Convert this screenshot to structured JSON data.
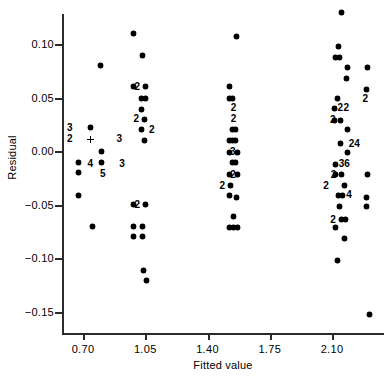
{
  "chart_data": {
    "type": "scatter",
    "title": "",
    "xlabel": "Fitted value",
    "ylabel": "Residual",
    "xlim": [
      0.58,
      2.39
    ],
    "ylim": [
      -0.168,
      0.138
    ],
    "grid": false,
    "legend": null,
    "xticks": [
      0.7,
      1.05,
      1.4,
      1.75,
      2.1
    ],
    "xtick_labels": [
      "0.70",
      "1.05",
      "1.40",
      "1.75",
      "2.10"
    ],
    "yticks": [
      0.1,
      0.05,
      0.0,
      -0.05,
      -0.1,
      -0.15
    ],
    "ytick_labels": [
      "0.10",
      "0.05",
      "0.00",
      "−0.05",
      "−0.10",
      "−0.15"
    ],
    "marker": "filled-diamond",
    "note": "Count digits next to a marker denote overplotted observations at that location.",
    "points": [
      {
        "x": 0.672,
        "y": 0.022,
        "count": 3,
        "label_side": "left",
        "marker": "none"
      },
      {
        "x": 0.672,
        "y": 0.011,
        "count": 2,
        "label_side": "left",
        "marker": "none"
      },
      {
        "x": 0.672,
        "y": -0.011,
        "count": 1,
        "marker": "dot"
      },
      {
        "x": 0.672,
        "y": -0.02,
        "count": 1,
        "marker": "dot"
      },
      {
        "x": 0.672,
        "y": -0.041,
        "count": 1,
        "marker": "dot"
      },
      {
        "x": 0.74,
        "y": 0.022,
        "count": 1,
        "marker": "dot"
      },
      {
        "x": 0.74,
        "y": 0.011,
        "count": 1,
        "marker": "plus"
      },
      {
        "x": 0.742,
        "y": -0.012,
        "count": 4,
        "label_side": "center",
        "marker": "none"
      },
      {
        "x": 0.752,
        "y": -0.07,
        "count": 1,
        "marker": "dot"
      },
      {
        "x": 0.8,
        "y": 0.08,
        "count": 1,
        "marker": "dot"
      },
      {
        "x": 0.806,
        "y": 0.0,
        "count": 1,
        "marker": "dot"
      },
      {
        "x": 0.806,
        "y": -0.011,
        "count": 1,
        "marker": "dot"
      },
      {
        "x": 0.812,
        "y": -0.021,
        "count": 5,
        "label_side": "center",
        "marker": "none"
      },
      {
        "x": 0.905,
        "y": 0.011,
        "count": 3,
        "label_side": "center",
        "marker": "none"
      },
      {
        "x": 0.92,
        "y": -0.012,
        "count": 3,
        "label_side": "center",
        "marker": "none"
      },
      {
        "x": 0.986,
        "y": 0.11,
        "count": 1,
        "marker": "dot"
      },
      {
        "x": 0.982,
        "y": 0.06,
        "count": 1,
        "marker": "dot"
      },
      {
        "x": 1.035,
        "y": 0.089,
        "count": 1,
        "marker": "dot"
      },
      {
        "x": 1.052,
        "y": 0.06,
        "count": 2,
        "label_side": "left",
        "marker": "dot"
      },
      {
        "x": 1.03,
        "y": 0.049,
        "count": 1,
        "marker": "dot"
      },
      {
        "x": 1.052,
        "y": 0.049,
        "count": 1,
        "marker": "dot"
      },
      {
        "x": 1.03,
        "y": 0.039,
        "count": 1,
        "marker": "dot"
      },
      {
        "x": 1.046,
        "y": 0.03,
        "count": 2,
        "label_side": "left",
        "marker": "dot"
      },
      {
        "x": 1.03,
        "y": 0.02,
        "count": 1,
        "marker": "dot"
      },
      {
        "x": 1.048,
        "y": 0.02,
        "count": 2,
        "label_side": "right",
        "marker": "none"
      },
      {
        "x": 1.046,
        "y": 0.01,
        "count": 1,
        "marker": "dot"
      },
      {
        "x": 0.982,
        "y": -0.05,
        "count": 1,
        "marker": "dot"
      },
      {
        "x": 1.052,
        "y": -0.05,
        "count": 2,
        "label_side": "left",
        "marker": "dot"
      },
      {
        "x": 0.982,
        "y": -0.07,
        "count": 1,
        "marker": "dot"
      },
      {
        "x": 1.035,
        "y": -0.07,
        "count": 1,
        "marker": "dot"
      },
      {
        "x": 0.982,
        "y": -0.08,
        "count": 1,
        "marker": "dot"
      },
      {
        "x": 1.035,
        "y": -0.08,
        "count": 1,
        "marker": "dot"
      },
      {
        "x": 1.04,
        "y": -0.111,
        "count": 1,
        "marker": "dot"
      },
      {
        "x": 1.056,
        "y": -0.121,
        "count": 1,
        "marker": "dot"
      },
      {
        "x": 1.565,
        "y": 0.107,
        "count": 1,
        "marker": "dot"
      },
      {
        "x": 1.525,
        "y": 0.06,
        "count": 1,
        "marker": "dot"
      },
      {
        "x": 1.522,
        "y": 0.049,
        "count": 1,
        "marker": "dot"
      },
      {
        "x": 1.54,
        "y": 0.049,
        "count": 1,
        "marker": "dot"
      },
      {
        "x": 1.548,
        "y": 0.04,
        "count": 2,
        "label_side": "center",
        "marker": "none"
      },
      {
        "x": 1.548,
        "y": 0.03,
        "count": 2,
        "label_side": "center",
        "marker": "none"
      },
      {
        "x": 1.54,
        "y": 0.02,
        "count": 1,
        "marker": "dot"
      },
      {
        "x": 1.558,
        "y": 0.02,
        "count": 1,
        "marker": "dot"
      },
      {
        "x": 1.522,
        "y": 0.01,
        "count": 1,
        "marker": "dot"
      },
      {
        "x": 1.54,
        "y": 0.01,
        "count": 1,
        "marker": "dot"
      },
      {
        "x": 1.558,
        "y": 0.01,
        "count": 1,
        "marker": "dot"
      },
      {
        "x": 1.522,
        "y": -0.001,
        "count": 1,
        "marker": "dot"
      },
      {
        "x": 1.543,
        "y": -0.001,
        "count": 3,
        "label_side": "center",
        "marker": "none"
      },
      {
        "x": 1.566,
        "y": -0.001,
        "count": 1,
        "marker": "dot"
      },
      {
        "x": 1.54,
        "y": -0.011,
        "count": 1,
        "marker": "dot"
      },
      {
        "x": 1.558,
        "y": -0.011,
        "count": 1,
        "marker": "dot"
      },
      {
        "x": 1.522,
        "y": -0.022,
        "count": 1,
        "marker": "dot"
      },
      {
        "x": 1.545,
        "y": -0.022,
        "count": 2,
        "label_side": "center",
        "marker": "none"
      },
      {
        "x": 1.566,
        "y": -0.022,
        "count": 1,
        "marker": "dot"
      },
      {
        "x": 1.53,
        "y": -0.032,
        "count": 2,
        "label_side": "left",
        "marker": "dot"
      },
      {
        "x": 1.522,
        "y": -0.041,
        "count": 1,
        "marker": "dot"
      },
      {
        "x": 1.562,
        "y": -0.043,
        "count": 1,
        "marker": "dot"
      },
      {
        "x": 1.548,
        "y": -0.061,
        "count": 1,
        "marker": "dot"
      },
      {
        "x": 1.522,
        "y": -0.071,
        "count": 1,
        "marker": "dot"
      },
      {
        "x": 1.545,
        "y": -0.071,
        "count": 1,
        "marker": "dot"
      },
      {
        "x": 1.566,
        "y": -0.071,
        "count": 1,
        "marker": "dot"
      },
      {
        "x": 2.155,
        "y": 0.129,
        "count": 1,
        "marker": "dot"
      },
      {
        "x": 2.138,
        "y": 0.098,
        "count": 1,
        "marker": "dot"
      },
      {
        "x": 2.118,
        "y": 0.087,
        "count": 1,
        "marker": "dot"
      },
      {
        "x": 2.14,
        "y": 0.087,
        "count": 1,
        "marker": "dot"
      },
      {
        "x": 2.188,
        "y": 0.078,
        "count": 1,
        "marker": "dot"
      },
      {
        "x": 2.3,
        "y": 0.078,
        "count": 1,
        "marker": "dot"
      },
      {
        "x": 2.184,
        "y": 0.068,
        "count": 1,
        "marker": "dot"
      },
      {
        "x": 2.292,
        "y": 0.058,
        "count": 1,
        "marker": "dot"
      },
      {
        "x": 2.13,
        "y": 0.049,
        "count": 1,
        "marker": "dot"
      },
      {
        "x": 2.288,
        "y": 0.049,
        "count": 2,
        "label_side": "center",
        "marker": "none"
      },
      {
        "x": 2.112,
        "y": 0.04,
        "count": 1,
        "marker": "dot"
      },
      {
        "x": 2.148,
        "y": 0.04,
        "count": 2,
        "label_side": "center",
        "marker": "none"
      },
      {
        "x": 2.182,
        "y": 0.04,
        "count": 2,
        "label_side": "center",
        "marker": "none"
      },
      {
        "x": 2.112,
        "y": 0.029,
        "count": 1,
        "marker": "dot"
      },
      {
        "x": 2.15,
        "y": 0.029,
        "count": 2,
        "label_side": "left",
        "marker": "dot"
      },
      {
        "x": 2.185,
        "y": 0.02,
        "count": 1,
        "marker": "dot"
      },
      {
        "x": 2.15,
        "y": 0.007,
        "count": 1,
        "marker": "dot"
      },
      {
        "x": 2.172,
        "y": 0.007,
        "count": 24,
        "label_side": "right",
        "marker": "none"
      },
      {
        "x": 2.185,
        "y": -0.001,
        "count": 1,
        "marker": "dot"
      },
      {
        "x": 2.118,
        "y": -0.012,
        "count": 1,
        "marker": "dot"
      },
      {
        "x": 2.172,
        "y": -0.012,
        "count": 36,
        "label_side": "center",
        "marker": "none"
      },
      {
        "x": 2.118,
        "y": -0.022,
        "count": 1,
        "marker": "dot"
      },
      {
        "x": 2.155,
        "y": -0.022,
        "count": 2,
        "label_side": "left",
        "marker": "dot"
      },
      {
        "x": 2.3,
        "y": -0.022,
        "count": 1,
        "marker": "dot"
      },
      {
        "x": 2.112,
        "y": -0.032,
        "count": 2,
        "label_side": "left",
        "marker": "none"
      },
      {
        "x": 2.17,
        "y": -0.032,
        "count": 1,
        "marker": "dot"
      },
      {
        "x": 2.138,
        "y": -0.041,
        "count": 1,
        "marker": "dot"
      },
      {
        "x": 2.158,
        "y": -0.041,
        "count": 4,
        "label_side": "right",
        "marker": "dot"
      },
      {
        "x": 2.296,
        "y": -0.043,
        "count": 1,
        "marker": "dot"
      },
      {
        "x": 2.14,
        "y": -0.052,
        "count": 1,
        "marker": "dot"
      },
      {
        "x": 2.296,
        "y": -0.052,
        "count": 1,
        "marker": "dot"
      },
      {
        "x": 2.152,
        "y": -0.064,
        "count": 2,
        "label_side": "left",
        "marker": "dot"
      },
      {
        "x": 2.178,
        "y": -0.064,
        "count": 1,
        "marker": "dot"
      },
      {
        "x": 2.118,
        "y": -0.071,
        "count": 1,
        "marker": "dot"
      },
      {
        "x": 2.172,
        "y": -0.081,
        "count": 1,
        "marker": "dot"
      },
      {
        "x": 2.13,
        "y": -0.102,
        "count": 1,
        "marker": "dot"
      },
      {
        "x": 2.31,
        "y": -0.152,
        "count": 1,
        "marker": "dot"
      }
    ]
  },
  "plot": {
    "x_axis_title": "Fitted value",
    "y_axis_title": "Residual"
  }
}
